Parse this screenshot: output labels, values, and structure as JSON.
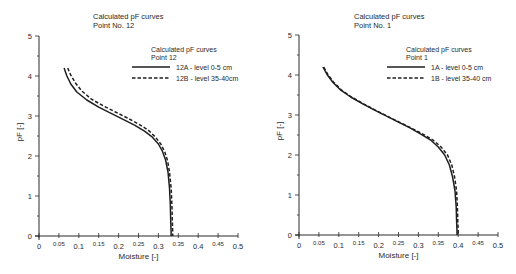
{
  "chart_data": [
    {
      "type": "line",
      "title": "Calculated pF curves",
      "subtitle": "Point No. 12",
      "xlabel": "Moisture [-]",
      "ylabel": "pF [-]",
      "xlim": [
        0,
        0.5
      ],
      "ylim": [
        0,
        5
      ],
      "grid": false,
      "x_ticks": [
        "0",
        "0.05",
        "0.1",
        "0.15",
        "0.2",
        "0.25",
        "0.3",
        "0.35",
        "0.4",
        "0.45",
        "0.5"
      ],
      "y_ticks": [
        "0",
        "1",
        "2",
        "3",
        "4",
        "5"
      ],
      "legend": {
        "title": "Calculated pF curves",
        "subtitle": "Point 12",
        "position": "upper right",
        "entries": [
          "12A - level 0-5 cm",
          "12B - level 35-40cm"
        ]
      },
      "series": [
        {
          "name": "12A - level 0-5 cm",
          "style": "solid",
          "x": [
            0.063,
            0.07,
            0.08,
            0.095,
            0.12,
            0.15,
            0.18,
            0.21,
            0.24,
            0.265,
            0.285,
            0.3,
            0.31,
            0.318,
            0.324,
            0.328,
            0.33,
            0.331,
            0.332,
            0.332
          ],
          "y": [
            4.2,
            4.0,
            3.8,
            3.6,
            3.4,
            3.22,
            3.07,
            2.92,
            2.77,
            2.62,
            2.47,
            2.3,
            2.12,
            1.9,
            1.6,
            1.2,
            0.8,
            0.4,
            0.1,
            0.0
          ]
        },
        {
          "name": "12B - level 35-40cm",
          "style": "dashed",
          "x": [
            0.072,
            0.08,
            0.092,
            0.108,
            0.132,
            0.162,
            0.192,
            0.222,
            0.25,
            0.274,
            0.292,
            0.306,
            0.316,
            0.323,
            0.328,
            0.332,
            0.334,
            0.335,
            0.336,
            0.336
          ],
          "y": [
            4.2,
            4.02,
            3.82,
            3.62,
            3.42,
            3.25,
            3.1,
            2.95,
            2.8,
            2.65,
            2.48,
            2.3,
            2.1,
            1.88,
            1.6,
            1.2,
            0.8,
            0.4,
            0.1,
            0.0
          ]
        }
      ]
    },
    {
      "type": "line",
      "title": "Calculated pF curves",
      "subtitle": "Point No. 1",
      "xlabel": "Moisture [-]",
      "ylabel": "pF [-]",
      "xlim": [
        0,
        0.5
      ],
      "ylim": [
        0,
        5
      ],
      "grid": false,
      "x_ticks": [
        "0",
        "0.05",
        "0.1",
        "0.15",
        "0.2",
        "0.25",
        "0.3",
        "0.35",
        "0.4",
        "0.45",
        "0.5"
      ],
      "y_ticks": [
        "0",
        "1",
        "2",
        "3",
        "4",
        "5"
      ],
      "legend": {
        "title": "Calculated pF curves",
        "subtitle": "Point 1",
        "position": "upper right",
        "entries": [
          "1A - level 0-5 cm",
          "1B - level 35-40 cm"
        ]
      },
      "series": [
        {
          "name": "1A - level 0-5 cm",
          "style": "solid",
          "x": [
            0.06,
            0.07,
            0.085,
            0.105,
            0.13,
            0.16,
            0.19,
            0.22,
            0.25,
            0.28,
            0.305,
            0.33,
            0.35,
            0.366,
            0.378,
            0.386,
            0.392,
            0.395,
            0.396,
            0.397,
            0.397
          ],
          "y": [
            4.2,
            4.02,
            3.82,
            3.62,
            3.45,
            3.28,
            3.12,
            2.97,
            2.82,
            2.67,
            2.53,
            2.38,
            2.2,
            2.0,
            1.75,
            1.45,
            1.1,
            0.7,
            0.35,
            0.1,
            0.0
          ]
        },
        {
          "name": "1B - level 35-40 cm",
          "style": "dashed",
          "x": [
            0.062,
            0.072,
            0.087,
            0.107,
            0.132,
            0.162,
            0.192,
            0.222,
            0.252,
            0.283,
            0.31,
            0.336,
            0.357,
            0.373,
            0.384,
            0.391,
            0.396,
            0.398,
            0.399,
            0.4,
            0.4
          ],
          "y": [
            4.2,
            4.02,
            3.82,
            3.62,
            3.45,
            3.28,
            3.12,
            2.97,
            2.82,
            2.67,
            2.53,
            2.38,
            2.2,
            2.0,
            1.75,
            1.45,
            1.1,
            0.7,
            0.35,
            0.1,
            0.0
          ]
        }
      ]
    }
  ],
  "layout": [
    {
      "x0": 39,
      "y0": 236,
      "xscale": 398,
      "yscale": 40,
      "title_x": 93,
      "legend_x": 132,
      "legend_y": 49
    },
    {
      "x0": 299,
      "y0": 235,
      "xscale": 398,
      "yscale": 40,
      "title_x": 354,
      "legend_x": 387,
      "legend_y": 49
    }
  ],
  "colors": {
    "axis": "#2a2a2a",
    "line": "#1e1e1e",
    "background": "#ffffff"
  }
}
